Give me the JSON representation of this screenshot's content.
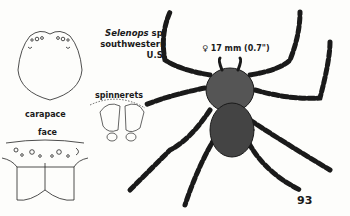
{
  "species": {
    "genus": "Selenops",
    "suffix": " sp.",
    "region": "southwestern U.S."
  },
  "size": {
    "sex_symbol": "♀",
    "text": "17 mm (0.7\")"
  },
  "labels": {
    "carapace": "carapace",
    "face": "face",
    "spinnerets": "spinnerets"
  },
  "page_number": "93",
  "colors": {
    "ink": "#1a1a1a",
    "paper": "#fdfdfb"
  }
}
